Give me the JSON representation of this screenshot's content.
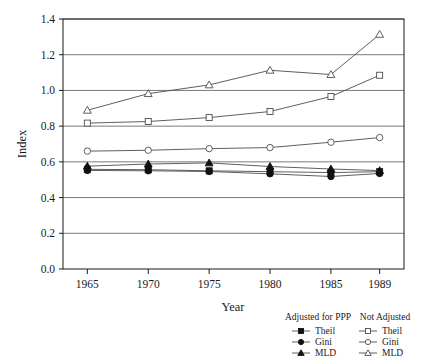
{
  "chart_data": {
    "type": "line",
    "title": "",
    "xlabel": "Year",
    "ylabel": "Index",
    "categories": [
      "1965",
      "1970",
      "1975",
      "1980",
      "1985",
      "1989"
    ],
    "x": [
      1965,
      1970,
      1975,
      1980,
      1985,
      1989
    ],
    "xlim": [
      1963,
      1991
    ],
    "ylim": [
      0.0,
      1.4
    ],
    "yticks": [
      "0.0",
      "0.2",
      "0.4",
      "0.6",
      "0.8",
      "1.0",
      "1.2",
      "1.4"
    ],
    "ytick_values": [
      0.0,
      0.2,
      0.4,
      0.6,
      0.8,
      1.0,
      1.2,
      1.4
    ],
    "grid": "horizontal",
    "legend_position": "below-right",
    "series": [
      {
        "name": "Theil",
        "group": "Adjusted for PPP",
        "marker": "filled-square",
        "values": [
          0.558,
          0.556,
          0.55,
          0.545,
          0.54,
          0.545
        ]
      },
      {
        "name": "Gini",
        "group": "Adjusted for PPP",
        "marker": "filled-circle",
        "values": [
          0.552,
          0.55,
          0.546,
          0.533,
          0.518,
          0.535
        ]
      },
      {
        "name": "MLD",
        "group": "Adjusted for PPP",
        "marker": "filled-triangle",
        "values": [
          0.576,
          0.588,
          0.594,
          0.574,
          0.56,
          0.551
        ]
      },
      {
        "name": "Theil",
        "group": "Not Adjusted",
        "marker": "open-square",
        "values": [
          0.817,
          0.826,
          0.848,
          0.882,
          0.966,
          1.085
        ]
      },
      {
        "name": "Gini",
        "group": "Not Adjusted",
        "marker": "open-circle",
        "values": [
          0.66,
          0.665,
          0.674,
          0.68,
          0.71,
          0.736
        ]
      },
      {
        "name": "MLD",
        "group": "Not Adjusted",
        "marker": "open-triangle",
        "values": [
          0.889,
          0.982,
          1.031,
          1.113,
          1.089,
          1.314
        ]
      }
    ]
  },
  "legend": {
    "columns": [
      {
        "heading": "Adjusted for PPP",
        "entries": [
          {
            "label": "Theil",
            "marker": "filled-square"
          },
          {
            "label": "Gini",
            "marker": "filled-circle"
          },
          {
            "label": "MLD",
            "marker": "filled-triangle"
          }
        ]
      },
      {
        "heading": "Not Adjusted",
        "entries": [
          {
            "label": "Theil",
            "marker": "open-square"
          },
          {
            "label": "Gini",
            "marker": "open-circle"
          },
          {
            "label": "MLD",
            "marker": "open-triangle"
          }
        ]
      }
    ]
  },
  "colors": {
    "line": "#4d4d4d",
    "marker_fill": "#111111",
    "marker_open_fill": "#ffffff",
    "axis": "#1a1a1a",
    "grid": "#6b6b6b",
    "background": "#ffffff"
  }
}
